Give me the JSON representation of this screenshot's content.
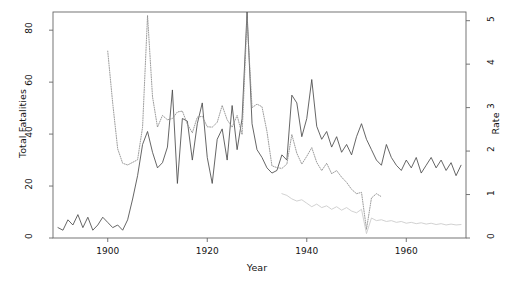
{
  "chart_data": {
    "type": "line",
    "title": "",
    "xlabel": "Year",
    "ylabel": "Total Fatalities",
    "ylabel_right": "Rate",
    "xlim": [
      1889,
      1972
    ],
    "ylim": [
      0,
      87
    ],
    "ylim_right": [
      0,
      5.2
    ],
    "xticks": [
      1900,
      1920,
      1940,
      1960
    ],
    "yticks": [
      0,
      20,
      40,
      60,
      80
    ],
    "yticks_right": [
      0,
      1,
      2,
      3,
      4,
      5
    ],
    "grid": false,
    "legend": "none",
    "frame": true,
    "series": [
      {
        "name": "Total Fatalities",
        "axis": "left",
        "style": "solid",
        "color": "#4a4a4a",
        "x": [
          1890,
          1891,
          1892,
          1893,
          1894,
          1895,
          1896,
          1897,
          1898,
          1899,
          1900,
          1901,
          1902,
          1903,
          1904,
          1905,
          1906,
          1907,
          1908,
          1909,
          1910,
          1911,
          1912,
          1913,
          1914,
          1915,
          1916,
          1917,
          1918,
          1919,
          1920,
          1921,
          1922,
          1923,
          1924,
          1925,
          1926,
          1927,
          1928,
          1929,
          1930,
          1931,
          1932,
          1933,
          1934,
          1935,
          1936,
          1937,
          1938,
          1939,
          1940,
          1941,
          1942,
          1943,
          1944,
          1945,
          1946,
          1947,
          1948,
          1949,
          1950,
          1951,
          1952,
          1953,
          1954,
          1955,
          1956,
          1957,
          1958,
          1959,
          1960,
          1961,
          1962,
          1963,
          1964,
          1965,
          1966,
          1967,
          1968,
          1969,
          1970,
          1971
        ],
        "values": [
          4,
          3,
          7,
          5,
          9,
          4,
          8,
          3,
          5,
          8,
          6,
          4,
          5,
          3,
          7,
          15,
          24,
          36,
          41,
          33,
          27,
          29,
          35,
          57,
          21,
          46,
          45,
          30,
          44,
          52,
          31,
          21,
          38,
          42,
          30,
          51,
          34,
          46,
          87,
          44,
          34,
          31,
          27,
          25,
          26,
          32,
          30,
          55,
          52,
          39,
          46,
          61,
          43,
          38,
          41,
          35,
          39,
          33,
          36,
          32,
          39,
          44,
          38,
          34,
          30,
          28,
          36,
          31,
          28,
          26,
          30,
          27,
          31,
          25,
          28,
          31,
          27,
          30,
          26,
          29,
          24,
          28
        ]
      },
      {
        "name": "Rate (dotted)",
        "axis": "right",
        "style": "dotted",
        "color": "#8a8a8a",
        "x": [
          1900,
          1901,
          1902,
          1903,
          1904,
          1905,
          1906,
          1907,
          1908,
          1909,
          1910,
          1911,
          1912,
          1913,
          1914,
          1915,
          1916,
          1917,
          1918,
          1919,
          1920,
          1921,
          1922,
          1923,
          1924,
          1925,
          1926,
          1927,
          1928,
          1929,
          1930,
          1931,
          1932,
          1933,
          1934,
          1935,
          1936,
          1937,
          1938,
          1939,
          1940,
          1941,
          1942,
          1943,
          1944,
          1945,
          1946,
          1947,
          1948,
          1949,
          1950,
          1951,
          1952,
          1953,
          1954,
          1955
        ],
        "values": [
          4.3,
          3.1,
          2.05,
          1.72,
          1.68,
          1.74,
          1.8,
          2.55,
          5.12,
          3.25,
          2.55,
          2.82,
          2.72,
          2.75,
          2.9,
          2.92,
          2.62,
          2.42,
          2.78,
          2.8,
          2.56,
          2.55,
          2.66,
          3.05,
          2.72,
          2.55,
          2.82,
          2.38,
          5.05,
          3.0,
          3.08,
          3.02,
          2.45,
          1.66,
          1.62,
          1.6,
          1.7,
          2.38,
          1.95,
          1.7,
          1.88,
          2.08,
          1.74,
          1.55,
          1.72,
          1.48,
          1.55,
          1.4,
          1.28,
          1.12,
          1.02,
          1.05,
          0.2,
          0.92,
          1.02,
          0.95
        ]
      },
      {
        "name": "Rate (light)",
        "axis": "right",
        "style": "solid",
        "color": "#cccccc",
        "x": [
          1935,
          1936,
          1937,
          1938,
          1939,
          1940,
          1941,
          1942,
          1943,
          1944,
          1945,
          1946,
          1947,
          1948,
          1949,
          1950,
          1951,
          1952,
          1953,
          1954,
          1955,
          1956,
          1957,
          1958,
          1959,
          1960,
          1961,
          1962,
          1963,
          1964,
          1965,
          1966,
          1967,
          1968,
          1969,
          1970,
          1971
        ],
        "values": [
          1.02,
          0.98,
          0.9,
          0.85,
          0.88,
          0.8,
          0.72,
          0.78,
          0.7,
          0.74,
          0.66,
          0.72,
          0.64,
          0.7,
          0.62,
          0.58,
          0.66,
          0.1,
          0.46,
          0.4,
          0.42,
          0.38,
          0.4,
          0.36,
          0.38,
          0.34,
          0.36,
          0.33,
          0.35,
          0.32,
          0.34,
          0.31,
          0.33,
          0.3,
          0.32,
          0.3,
          0.31
        ]
      }
    ]
  },
  "axes": {
    "left_title": "Total Fatalities",
    "right_title": "Rate",
    "x_title": "Year"
  }
}
